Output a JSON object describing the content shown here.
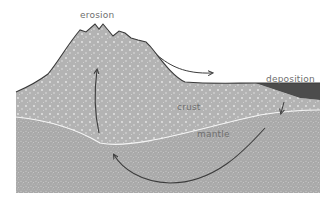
{
  "diagram": {
    "type": "cross-section",
    "labels": {
      "erosion": "erosion",
      "deposition": "deposition",
      "crust": "crust",
      "mantle": "mantle"
    },
    "colors": {
      "background": "#ffffff",
      "crust_fill": "#b3b3b3",
      "crust_speckle": "#e6e6e6",
      "mantle_fill": "#a9a9a9",
      "mantle_speckle": "#d2d2d2",
      "sediment_fill": "#4c4c4c",
      "outline": "#3a3a3a",
      "boundary": "#f4f4f4",
      "arrow": "#3c3c3c",
      "label_text": "#6e6e6e"
    },
    "arrows": [
      {
        "name": "uplift-arrow",
        "direction": "up"
      },
      {
        "name": "erosion-transport-arrow",
        "direction": "right"
      },
      {
        "name": "mantle-circulation-arrow",
        "direction": "left-up"
      },
      {
        "name": "burial-arrow",
        "direction": "down"
      }
    ]
  }
}
